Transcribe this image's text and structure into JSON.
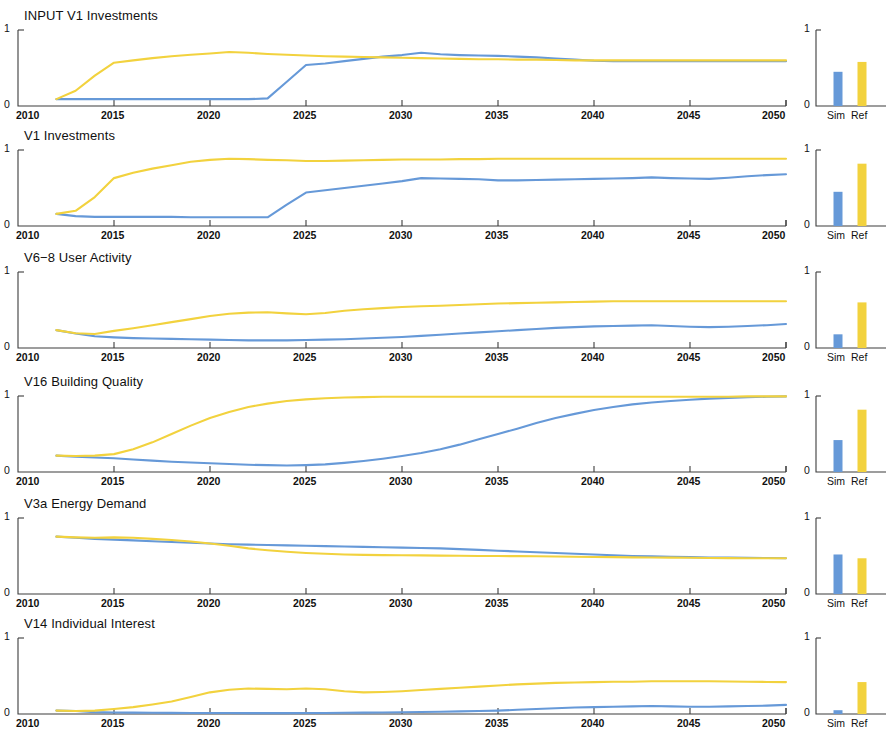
{
  "figure": {
    "width": 892,
    "height": 730,
    "background": "#ffffff",
    "panel_count": 6,
    "colors": {
      "sim_blue": "#6699D8",
      "ref_yellow": "#F2D23E",
      "axis": "#3d3d3d",
      "text": "#111111"
    }
  },
  "axes": {
    "x_ticks": [
      "2010",
      "2015",
      "2020",
      "2025",
      "2030",
      "2035",
      "2040",
      "2045",
      "2050"
    ],
    "x_tick_values": [
      2010,
      2015,
      2020,
      2025,
      2030,
      2035,
      2040,
      2045,
      2050
    ],
    "xlim": [
      2010,
      2050
    ],
    "y_ticks": [
      "0",
      "1"
    ],
    "ylim": [
      0,
      1
    ],
    "bar_categories": [
      "Sim",
      "Ref"
    ],
    "bar_y_ticks": [
      "0",
      "1"
    ],
    "bar_ylim": [
      0,
      1
    ]
  },
  "chart_data": [
    {
      "type": "line",
      "title": "INPUT V1 Investments",
      "xlabel": "",
      "ylabel": "",
      "xlim": [
        2010,
        2050
      ],
      "ylim": [
        0,
        1
      ],
      "grid": false,
      "legend": null,
      "x": [
        2012,
        2013,
        2014,
        2015,
        2016,
        2017,
        2018,
        2019,
        2020,
        2021,
        2022,
        2023,
        2024,
        2025,
        2026,
        2027,
        2028,
        2029,
        2030,
        2031,
        2032,
        2033,
        2034,
        2035,
        2036,
        2037,
        2038,
        2039,
        2040,
        2041,
        2042,
        2043,
        2044,
        2045,
        2046,
        2047,
        2048,
        2049,
        2050
      ],
      "series": [
        {
          "name": "Sim",
          "color": "#6699D8",
          "values": [
            0.09,
            0.09,
            0.09,
            0.09,
            0.09,
            0.09,
            0.09,
            0.09,
            0.09,
            0.09,
            0.09,
            0.1,
            0.32,
            0.54,
            0.56,
            0.59,
            0.62,
            0.65,
            0.67,
            0.7,
            0.68,
            0.67,
            0.665,
            0.66,
            0.65,
            0.64,
            0.625,
            0.61,
            0.595,
            0.59,
            0.59,
            0.59,
            0.59,
            0.59,
            0.59,
            0.59,
            0.59,
            0.59,
            0.59
          ]
        },
        {
          "name": "Ref",
          "color": "#F2D23E",
          "values": [
            0.09,
            0.2,
            0.4,
            0.57,
            0.6,
            0.63,
            0.655,
            0.675,
            0.69,
            0.71,
            0.7,
            0.685,
            0.675,
            0.665,
            0.655,
            0.65,
            0.645,
            0.64,
            0.635,
            0.63,
            0.625,
            0.62,
            0.615,
            0.615,
            0.61,
            0.61,
            0.605,
            0.6,
            0.6,
            0.6,
            0.6,
            0.6,
            0.6,
            0.6,
            0.6,
            0.6,
            0.6,
            0.6,
            0.6
          ]
        }
      ],
      "bar_chart": {
        "type": "bar",
        "categories": [
          "Sim",
          "Ref"
        ],
        "values": [
          0.45,
          0.58
        ],
        "colors": [
          "#6699D8",
          "#F2D23E"
        ],
        "ylim": [
          0,
          1
        ]
      }
    },
    {
      "type": "line",
      "title": "V1 Investments",
      "xlabel": "",
      "ylabel": "",
      "xlim": [
        2010,
        2050
      ],
      "ylim": [
        0,
        1
      ],
      "grid": false,
      "legend": null,
      "x": [
        2012,
        2013,
        2014,
        2015,
        2016,
        2017,
        2018,
        2019,
        2020,
        2021,
        2022,
        2023,
        2024,
        2025,
        2026,
        2027,
        2028,
        2029,
        2030,
        2031,
        2032,
        2033,
        2034,
        2035,
        2036,
        2037,
        2038,
        2039,
        2040,
        2041,
        2042,
        2043,
        2044,
        2045,
        2046,
        2047,
        2048,
        2049,
        2050
      ],
      "series": [
        {
          "name": "Sim",
          "color": "#6699D8",
          "values": [
            0.16,
            0.13,
            0.12,
            0.12,
            0.12,
            0.12,
            0.12,
            0.115,
            0.115,
            0.115,
            0.115,
            0.115,
            0.28,
            0.44,
            0.47,
            0.5,
            0.53,
            0.56,
            0.59,
            0.63,
            0.625,
            0.62,
            0.615,
            0.6,
            0.6,
            0.605,
            0.61,
            0.615,
            0.62,
            0.625,
            0.63,
            0.64,
            0.63,
            0.625,
            0.62,
            0.635,
            0.655,
            0.67,
            0.68
          ]
        },
        {
          "name": "Ref",
          "color": "#F2D23E",
          "values": [
            0.16,
            0.2,
            0.38,
            0.63,
            0.7,
            0.755,
            0.8,
            0.845,
            0.87,
            0.885,
            0.88,
            0.87,
            0.865,
            0.855,
            0.855,
            0.86,
            0.865,
            0.87,
            0.875,
            0.875,
            0.875,
            0.88,
            0.88,
            0.885,
            0.885,
            0.885,
            0.885,
            0.885,
            0.885,
            0.885,
            0.885,
            0.885,
            0.885,
            0.885,
            0.885,
            0.885,
            0.885,
            0.885,
            0.885
          ]
        }
      ],
      "bar_chart": {
        "type": "bar",
        "categories": [
          "Sim",
          "Ref"
        ],
        "values": [
          0.45,
          0.82
        ],
        "colors": [
          "#6699D8",
          "#F2D23E"
        ],
        "ylim": [
          0,
          1
        ]
      }
    },
    {
      "type": "line",
      "title": "V6−8 User Activity",
      "xlabel": "",
      "ylabel": "",
      "xlim": [
        2010,
        2050
      ],
      "ylim": [
        0,
        1
      ],
      "grid": false,
      "legend": null,
      "x": [
        2012,
        2013,
        2014,
        2015,
        2016,
        2017,
        2018,
        2019,
        2020,
        2021,
        2022,
        2023,
        2024,
        2025,
        2026,
        2027,
        2028,
        2029,
        2030,
        2031,
        2032,
        2033,
        2034,
        2035,
        2036,
        2037,
        2038,
        2039,
        2040,
        2041,
        2042,
        2043,
        2044,
        2045,
        2046,
        2047,
        2048,
        2049,
        2050
      ],
      "series": [
        {
          "name": "Sim",
          "color": "#6699D8",
          "values": [
            0.235,
            0.19,
            0.155,
            0.14,
            0.13,
            0.125,
            0.12,
            0.115,
            0.11,
            0.105,
            0.1,
            0.1,
            0.1,
            0.105,
            0.11,
            0.115,
            0.125,
            0.135,
            0.145,
            0.16,
            0.175,
            0.19,
            0.205,
            0.22,
            0.235,
            0.25,
            0.265,
            0.275,
            0.285,
            0.29,
            0.295,
            0.3,
            0.29,
            0.28,
            0.275,
            0.28,
            0.29,
            0.3,
            0.315
          ]
        },
        {
          "name": "Ref",
          "color": "#F2D23E",
          "values": [
            0.235,
            0.195,
            0.185,
            0.225,
            0.26,
            0.3,
            0.34,
            0.38,
            0.42,
            0.45,
            0.465,
            0.47,
            0.455,
            0.445,
            0.46,
            0.49,
            0.51,
            0.525,
            0.54,
            0.55,
            0.555,
            0.565,
            0.575,
            0.585,
            0.59,
            0.595,
            0.6,
            0.605,
            0.61,
            0.615,
            0.615,
            0.615,
            0.615,
            0.615,
            0.615,
            0.615,
            0.615,
            0.615,
            0.615
          ]
        }
      ],
      "bar_chart": {
        "type": "bar",
        "categories": [
          "Sim",
          "Ref"
        ],
        "values": [
          0.18,
          0.6
        ],
        "colors": [
          "#6699D8",
          "#F2D23E"
        ],
        "ylim": [
          0,
          1
        ]
      }
    },
    {
      "type": "line",
      "title": "V16 Building Quality",
      "xlabel": "",
      "ylabel": "",
      "xlim": [
        2010,
        2050
      ],
      "ylim": [
        0,
        1
      ],
      "grid": false,
      "legend": null,
      "x": [
        2012,
        2013,
        2014,
        2015,
        2016,
        2017,
        2018,
        2019,
        2020,
        2021,
        2022,
        2023,
        2024,
        2025,
        2026,
        2027,
        2028,
        2029,
        2030,
        2031,
        2032,
        2033,
        2034,
        2035,
        2036,
        2037,
        2038,
        2039,
        2040,
        2041,
        2042,
        2043,
        2044,
        2045,
        2046,
        2047,
        2048,
        2049,
        2050
      ],
      "series": [
        {
          "name": "Sim",
          "color": "#6699D8",
          "values": [
            0.215,
            0.2,
            0.19,
            0.18,
            0.165,
            0.15,
            0.135,
            0.125,
            0.115,
            0.105,
            0.095,
            0.09,
            0.085,
            0.09,
            0.1,
            0.12,
            0.145,
            0.175,
            0.21,
            0.25,
            0.3,
            0.36,
            0.43,
            0.5,
            0.57,
            0.645,
            0.71,
            0.765,
            0.815,
            0.855,
            0.89,
            0.915,
            0.935,
            0.95,
            0.965,
            0.975,
            0.985,
            0.99,
            0.995
          ]
        },
        {
          "name": "Ref",
          "color": "#F2D23E",
          "values": [
            0.215,
            0.21,
            0.215,
            0.235,
            0.3,
            0.39,
            0.5,
            0.61,
            0.71,
            0.79,
            0.855,
            0.9,
            0.935,
            0.955,
            0.97,
            0.98,
            0.985,
            0.99,
            0.99,
            0.99,
            0.99,
            0.99,
            0.99,
            0.99,
            0.99,
            0.99,
            0.99,
            0.99,
            0.99,
            0.99,
            0.99,
            0.99,
            0.99,
            0.99,
            0.99,
            0.99,
            0.995,
            0.995,
            0.995
          ]
        }
      ],
      "bar_chart": {
        "type": "bar",
        "categories": [
          "Sim",
          "Ref"
        ],
        "values": [
          0.42,
          0.82
        ],
        "colors": [
          "#6699D8",
          "#F2D23E"
        ],
        "ylim": [
          0,
          1
        ]
      }
    },
    {
      "type": "line",
      "title": "V3a Energy Demand",
      "xlabel": "",
      "ylabel": "",
      "xlim": [
        2010,
        2050
      ],
      "ylim": [
        0,
        1
      ],
      "grid": false,
      "legend": null,
      "x": [
        2012,
        2013,
        2014,
        2015,
        2016,
        2017,
        2018,
        2019,
        2020,
        2021,
        2022,
        2023,
        2024,
        2025,
        2026,
        2027,
        2028,
        2029,
        2030,
        2031,
        2032,
        2033,
        2034,
        2035,
        2036,
        2037,
        2038,
        2039,
        2040,
        2041,
        2042,
        2043,
        2044,
        2045,
        2046,
        2047,
        2048,
        2049,
        2050
      ],
      "series": [
        {
          "name": "Sim",
          "color": "#6699D8",
          "values": [
            0.755,
            0.74,
            0.725,
            0.715,
            0.705,
            0.695,
            0.685,
            0.675,
            0.665,
            0.655,
            0.65,
            0.645,
            0.64,
            0.635,
            0.63,
            0.625,
            0.62,
            0.615,
            0.61,
            0.605,
            0.6,
            0.59,
            0.58,
            0.57,
            0.56,
            0.55,
            0.54,
            0.53,
            0.52,
            0.51,
            0.5,
            0.495,
            0.49,
            0.485,
            0.48,
            0.478,
            0.475,
            0.473,
            0.47
          ]
        },
        {
          "name": "Ref",
          "color": "#F2D23E",
          "values": [
            0.755,
            0.745,
            0.74,
            0.745,
            0.74,
            0.725,
            0.71,
            0.69,
            0.665,
            0.635,
            0.6,
            0.575,
            0.555,
            0.54,
            0.53,
            0.52,
            0.515,
            0.512,
            0.51,
            0.508,
            0.505,
            0.503,
            0.5,
            0.5,
            0.498,
            0.496,
            0.494,
            0.49,
            0.487,
            0.485,
            0.482,
            0.48,
            0.478,
            0.476,
            0.474,
            0.472,
            0.47,
            0.47,
            0.47
          ]
        }
      ],
      "bar_chart": {
        "type": "bar",
        "categories": [
          "Sim",
          "Ref"
        ],
        "values": [
          0.52,
          0.47
        ],
        "colors": [
          "#6699D8",
          "#F2D23E"
        ],
        "ylim": [
          0,
          1
        ]
      }
    },
    {
      "type": "line",
      "title": "V14 Individual Interest",
      "xlabel": "",
      "ylabel": "",
      "xlim": [
        2010,
        2050
      ],
      "ylim": [
        0,
        1
      ],
      "grid": false,
      "legend": null,
      "x": [
        2012,
        2013,
        2014,
        2015,
        2016,
        2017,
        2018,
        2019,
        2020,
        2021,
        2022,
        2023,
        2024,
        2025,
        2026,
        2027,
        2028,
        2029,
        2030,
        2031,
        2032,
        2033,
        2034,
        2035,
        2036,
        2037,
        2038,
        2039,
        2040,
        2041,
        2042,
        2043,
        2044,
        2045,
        2046,
        2047,
        2048,
        2049,
        2050
      ],
      "series": [
        {
          "name": "Sim",
          "color": "#6699D8",
          "values": [
            0.045,
            0.04,
            0.025,
            0.02,
            0.018,
            0.016,
            0.015,
            0.014,
            0.013,
            0.013,
            0.012,
            0.012,
            0.012,
            0.013,
            0.014,
            0.016,
            0.018,
            0.02,
            0.023,
            0.026,
            0.03,
            0.035,
            0.04,
            0.045,
            0.055,
            0.065,
            0.075,
            0.085,
            0.09,
            0.095,
            0.1,
            0.105,
            0.1,
            0.095,
            0.095,
            0.1,
            0.105,
            0.11,
            0.12
          ]
        },
        {
          "name": "Ref",
          "color": "#F2D23E",
          "values": [
            0.045,
            0.04,
            0.045,
            0.065,
            0.09,
            0.125,
            0.165,
            0.225,
            0.285,
            0.32,
            0.335,
            0.33,
            0.325,
            0.335,
            0.325,
            0.3,
            0.285,
            0.29,
            0.3,
            0.315,
            0.33,
            0.345,
            0.36,
            0.375,
            0.39,
            0.4,
            0.41,
            0.415,
            0.42,
            0.425,
            0.425,
            0.43,
            0.43,
            0.43,
            0.43,
            0.428,
            0.425,
            0.422,
            0.42
          ]
        }
      ],
      "bar_chart": {
        "type": "bar",
        "categories": [
          "Sim",
          "Ref"
        ],
        "values": [
          0.05,
          0.42
        ],
        "colors": [
          "#6699D8",
          "#F2D23E"
        ],
        "ylim": [
          0,
          1
        ]
      }
    }
  ]
}
